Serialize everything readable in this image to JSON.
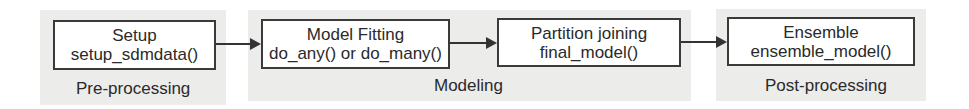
{
  "diagram": {
    "type": "flowchart",
    "direction": "left-to-right",
    "groups": [
      {
        "id": "pre",
        "label": "Pre-processing"
      },
      {
        "id": "modeling",
        "label": "Modeling"
      },
      {
        "id": "post",
        "label": "Post-processing"
      }
    ],
    "nodes": [
      {
        "id": "setup",
        "title": "Setup",
        "function": "setup_sdmdata()",
        "group": "pre"
      },
      {
        "id": "fitting",
        "title": "Model Fitting",
        "function": "do_any() or do_many()",
        "group": "modeling"
      },
      {
        "id": "joining",
        "title": "Partition joining",
        "function": "final_model()",
        "group": "modeling"
      },
      {
        "id": "ensemble",
        "title": "Ensemble",
        "function": "ensemble_model()",
        "group": "post"
      }
    ],
    "edges": [
      {
        "from": "setup",
        "to": "fitting"
      },
      {
        "from": "fitting",
        "to": "joining"
      },
      {
        "from": "joining",
        "to": "ensemble"
      }
    ]
  },
  "colors": {
    "group_background": "#ececea",
    "box_border": "#3a3a3a",
    "box_fill": "#ffffff",
    "text": "#2a2a2a"
  }
}
